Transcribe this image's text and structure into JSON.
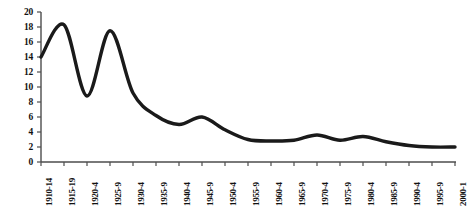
{
  "chart_data": {
    "type": "line",
    "title": "",
    "subtitle": "",
    "xlabel": "",
    "ylabel": "",
    "grid": false,
    "legend": "none",
    "line_color": "#1a1a1a",
    "axis_color": "#4d4d4d",
    "background": "#ffffff",
    "ylim": [
      0,
      20
    ],
    "yticks": [
      0,
      2,
      4,
      6,
      8,
      10,
      12,
      14,
      16,
      18,
      20
    ],
    "ytick_labels": [
      "0",
      "2",
      "4",
      "6",
      "8",
      "10",
      "12",
      "14",
      "16",
      "18",
      "20"
    ],
    "categories": [
      "1910-14",
      "1915-19",
      "1920-4",
      "1925-9",
      "1930-4",
      "1935-9",
      "1940-4",
      "1945-9",
      "1950-4",
      "1955-9",
      "1960-4",
      "1965-9",
      "1970-4",
      "1975-9",
      "1980-4",
      "1985-9",
      "1990-4",
      "1995-9",
      "2000-1"
    ],
    "values": [
      14.0,
      18.3,
      8.8,
      17.5,
      9.2,
      6.2,
      5.0,
      6.0,
      4.3,
      3.0,
      2.8,
      2.9,
      3.6,
      2.9,
      3.4,
      2.7,
      2.2,
      2.0,
      2.0
    ],
    "series": [
      {
        "name": "series-1",
        "values": [
          14.0,
          18.3,
          8.8,
          17.5,
          9.2,
          6.2,
          5.0,
          6.0,
          4.3,
          3.0,
          2.8,
          2.9,
          3.6,
          2.9,
          3.4,
          2.7,
          2.2,
          2.0,
          2.0
        ]
      }
    ]
  }
}
